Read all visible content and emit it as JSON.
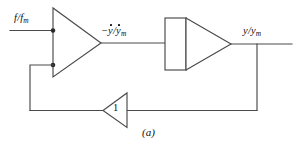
{
  "figure": {
    "caption": "(a)",
    "background_color": "#ffffff",
    "line_color": "#4a4a4a",
    "text_color": "#111111",
    "type": "control-system-block-diagram"
  },
  "labels": {
    "input_signal": {
      "text": "f/f_m",
      "numerator": "f",
      "slash": "/",
      "denominator": "f",
      "denominator_subscript": "m",
      "has_overdot": false
    },
    "mid_signal": {
      "text": "-ỹ/ỹ_m",
      "sign": "−",
      "numerator": "y",
      "slash": "/",
      "denominator": "y",
      "denominator_subscript": "m",
      "has_overdot": true
    },
    "output_signal": {
      "text": "y/y_m",
      "numerator": "y",
      "slash": "/",
      "denominator": "y",
      "denominator_subscript": "m",
      "has_overdot": false
    },
    "feedback_gain": {
      "text": "1"
    }
  },
  "blocks": {
    "summing_amplifier": {
      "name": "summing-amplifier",
      "shape": "triangle-right",
      "inputs": 2
    },
    "integrator": {
      "name": "integrator",
      "shape": "rectangle-with-triangle"
    },
    "feedback_amplifier": {
      "name": "feedback-amplifier",
      "shape": "triangle-left",
      "gain": "1"
    }
  },
  "wires": {
    "input_line": "horizontal input wire into summing amplifier",
    "forward_line": "summing amplifier output to integrator input",
    "output_line": "integrator output to right edge",
    "feedback_drop": "vertical drop from output node",
    "feedback_return": "bottom horizontal feedback wire through gain block",
    "feedback_riser": "vertical riser on left into second summing input"
  }
}
